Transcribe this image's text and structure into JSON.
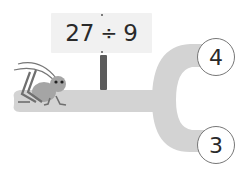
{
  "problem": {
    "dividend": "27",
    "operator": "÷",
    "divisor": "9"
  },
  "answers": [
    {
      "label": "4",
      "position": "top"
    },
    {
      "label": "3",
      "position": "bottom"
    }
  ],
  "colors": {
    "path": "#d2d2d2",
    "sign": "#f1f1f1",
    "post": "#5c5c5c",
    "cricket": "#9a9a9a"
  },
  "icons": {
    "character": "cricket-icon"
  }
}
